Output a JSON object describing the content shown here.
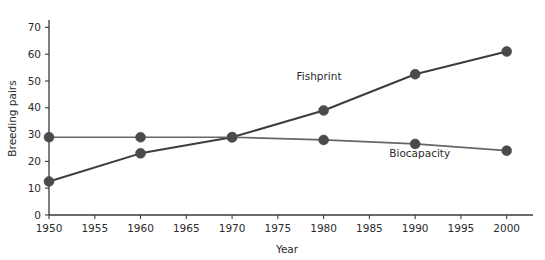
{
  "chart_data": {
    "type": "line",
    "title": "",
    "xlabel": "Year",
    "ylabel": "Breeding pairs",
    "x": [
      1950,
      1960,
      1970,
      1980,
      1990,
      2000
    ],
    "xlim": [
      1950,
      2002
    ],
    "ylim": [
      0,
      72
    ],
    "xticks": [
      "1950",
      "1955",
      "1960",
      "1965",
      "1970",
      "1975",
      "1980",
      "1985",
      "1990",
      "1995",
      "2000"
    ],
    "xtick_values": [
      1950,
      1955,
      1960,
      1965,
      1970,
      1975,
      1980,
      1985,
      1990,
      1995,
      2000
    ],
    "yticks": [
      "0",
      "10",
      "20",
      "30",
      "40",
      "50",
      "60",
      "70"
    ],
    "ytick_values": [
      0,
      10,
      20,
      30,
      40,
      50,
      60,
      70
    ],
    "grid": false,
    "legend_position": "inline-annotations",
    "series": [
      {
        "name": "Fishprint",
        "values": [
          12.5,
          23,
          29,
          39,
          52.5,
          61
        ],
        "color": "#3d3d3d",
        "line_width": 2.0,
        "marker": "circle",
        "marker_size": 5.0,
        "label_x": 1979.5,
        "label_y": 50.5
      },
      {
        "name": "Biocapacity",
        "values": [
          29,
          29,
          29,
          28,
          26.5,
          24
        ],
        "color": "#666666",
        "line_width": 1.7,
        "marker": "circle",
        "marker_size": 5.0,
        "label_x": 1990.5,
        "label_y": 21.5
      }
    ]
  },
  "axes": {
    "x_axis_name": "Year",
    "y_axis_name": "Breeding pairs"
  },
  "colors": {
    "axis": "#3a3a3a",
    "text": "#2b2b2b",
    "marker": "#4a4a4a",
    "background": "#ffffff"
  }
}
